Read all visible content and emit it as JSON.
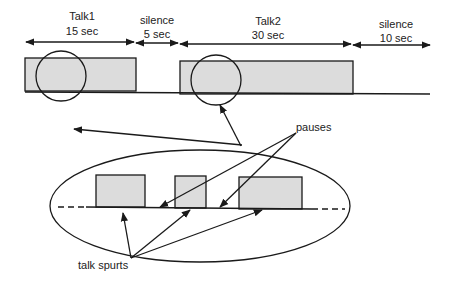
{
  "colors": {
    "box_fill": "#dcdcdc",
    "stroke": "#1a1a1a",
    "text": "#222222"
  },
  "timeline": {
    "segments": [
      {
        "name": "Talk1",
        "duration": "15 sec",
        "type": "talk"
      },
      {
        "name": "silence",
        "duration": "5 sec",
        "type": "silence"
      },
      {
        "name": "Talk2",
        "duration": "30 sec",
        "type": "talk"
      },
      {
        "name": "silence",
        "duration": "10 sec",
        "type": "silence"
      }
    ]
  },
  "zoom_view": {
    "talk_spurt_count": 3,
    "pause_count": 2
  },
  "labels": {
    "pauses": "pauses",
    "talk_spurts": "talk spurts"
  }
}
